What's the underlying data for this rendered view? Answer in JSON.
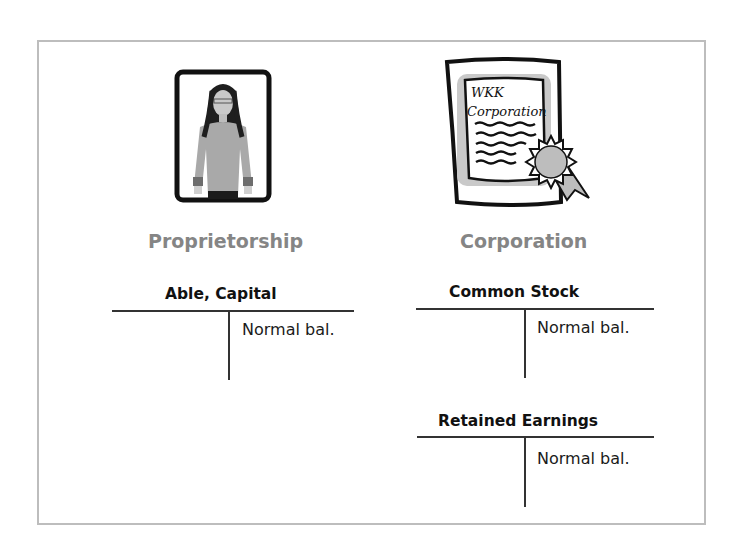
{
  "proprietorship": {
    "caption": "Proprietorship",
    "illustration": "woman-portrait-icon",
    "accounts": [
      {
        "title": "Able, Capital",
        "credit_side": "Normal bal."
      }
    ]
  },
  "corporation": {
    "caption": "Corporation",
    "illustration": "certificate-icon",
    "certificate_text": {
      "line1": "WKK",
      "line2": "Corporation"
    },
    "accounts": [
      {
        "title": "Common Stock",
        "credit_side": "Normal bal."
      },
      {
        "title": "Retained Earnings",
        "credit_side": "Normal bal."
      }
    ]
  },
  "colors": {
    "caption_gray": "#858585",
    "frame_border": "#bdbdbd",
    "line": "#333333"
  }
}
